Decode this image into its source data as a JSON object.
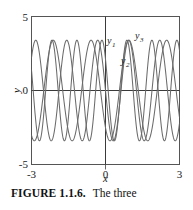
{
  "caption": {
    "label": "FIGURE 1.1.6.",
    "text": "The three"
  },
  "colors": {
    "frame": "#555555",
    "axis": "#3a3a3a",
    "curve": "#6b6b6b",
    "text": "#1a1a1a",
    "background": "#ffffff"
  },
  "chart_data": {
    "type": "line",
    "title": "",
    "xlabel": "x",
    "ylabel": "y",
    "xlim": [
      -3,
      3
    ],
    "ylim": [
      -5,
      5
    ],
    "xticks": [
      -3,
      0,
      3
    ],
    "xtick_labels": [
      "-3",
      "0",
      "3"
    ],
    "yticks": [
      -5,
      0,
      5
    ],
    "ytick_labels": [
      "-5",
      "0",
      "5"
    ],
    "grid": false,
    "legend": "inline-curve-labels",
    "annotations": [
      {
        "text": "y",
        "sub": "1",
        "x": 0.05,
        "y": 4.0
      },
      {
        "text": "y",
        "sub": "2",
        "x": 0.62,
        "y": 2.6
      },
      {
        "text": "y",
        "sub": "3",
        "x": 1.22,
        "y": 4.25
      }
    ],
    "series": [
      {
        "name": "y1",
        "amplitude": 3.4,
        "frequency": 5.0,
        "phase": 1.571,
        "formula": "3.4*cos(5.0*x)",
        "x": [
          -3,
          -2.8,
          -2.6,
          -2.4,
          -2.2,
          -2,
          -1.8,
          -1.6,
          -1.4,
          -1.2,
          -1,
          -0.8,
          -0.6,
          -0.4,
          -0.2,
          0,
          0.2,
          0.4,
          0.6,
          0.8,
          1,
          1.2,
          1.4,
          1.6,
          1.8,
          2,
          2.2,
          2.4,
          2.6,
          2.8,
          3
        ],
        "values": [
          2.59,
          -1.18,
          -2.06,
          3.34,
          -0.62,
          -2.77,
          2.83,
          0.61,
          -3.34,
          2.08,
          1.16,
          -2.6,
          0.68,
          2.76,
          -2.83,
          3.4,
          -2.83,
          2.76,
          0.68,
          -2.6,
          1.16,
          2.08,
          -3.34,
          0.61,
          2.83,
          -2.77,
          -0.62,
          3.34,
          -2.06,
          -1.18,
          2.59
        ]
      },
      {
        "name": "y2",
        "amplitude": 3.4,
        "frequency": 6.2,
        "phase": 0.9,
        "formula": "3.4*cos(6.2*x + 0.9)",
        "x": [
          -3,
          -2.8,
          -2.6,
          -2.4,
          -2.2,
          -2,
          -1.8,
          -1.6,
          -1.4,
          -1.2,
          -1,
          -0.8,
          -0.6,
          -0.4,
          -0.2,
          0,
          0.2,
          0.4,
          0.6,
          0.8,
          1,
          1.2,
          1.4,
          1.6,
          1.8,
          2,
          2.2,
          2.4,
          2.6,
          2.8,
          3
        ],
        "values": [
          -1.04,
          2.93,
          -3.18,
          1.3,
          1.05,
          -2.94,
          3.17,
          -1.26,
          -1.08,
          2.95,
          -3.16,
          1.23,
          1.11,
          -2.97,
          3.15,
          2.11,
          1.56,
          -3.36,
          2.66,
          -0.4,
          -2.11,
          3.39,
          -2.6,
          0.31,
          2.17,
          -3.4,
          2.54,
          -0.22,
          -2.23,
          3.4,
          -2.48
        ]
      },
      {
        "name": "y3",
        "amplitude": 3.4,
        "frequency": 4.1,
        "phase": 2.4,
        "formula": "3.4*cos(4.1*x + 2.4)",
        "x": [
          -3,
          -2.8,
          -2.6,
          -2.4,
          -2.2,
          -2,
          -1.8,
          -1.6,
          -1.4,
          -1.2,
          -1,
          -0.8,
          -0.6,
          -0.4,
          -0.2,
          0,
          0.2,
          0.4,
          0.6,
          0.8,
          1,
          1.2,
          1.4,
          1.6,
          1.8,
          2,
          2.2,
          2.4,
          2.6,
          2.8,
          3
        ],
        "values": [
          3.29,
          1.0,
          -1.9,
          -3.39,
          -1.91,
          0.99,
          3.28,
          2.67,
          -0.09,
          -2.89,
          -2.9,
          -0.11,
          2.66,
          3.29,
          0.97,
          -2.51,
          -3.39,
          -1.89,
          1.01,
          3.28,
          2.66,
          -0.11,
          -2.9,
          -2.89,
          -0.08,
          2.68,
          3.27,
          0.97,
          -1.92,
          -3.39,
          -1.89
        ]
      }
    ]
  }
}
